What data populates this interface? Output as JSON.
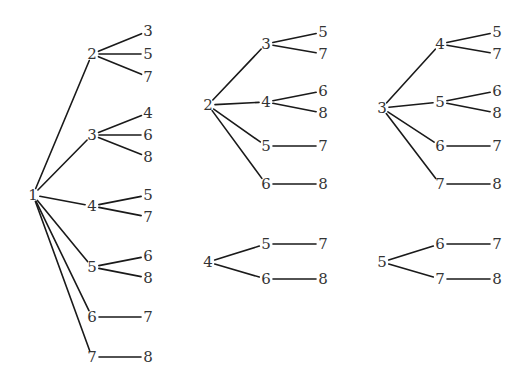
{
  "diagram": {
    "type": "tree-diagrams",
    "trees": [
      {
        "id": "tree-1",
        "root": {
          "label": "1",
          "x": 33,
          "y": 195
        },
        "children": [
          {
            "label": "2",
            "x": 92,
            "y": 54,
            "children": [
              {
                "label": "3",
                "x": 148,
                "y": 31
              },
              {
                "label": "5",
                "x": 148,
                "y": 54
              },
              {
                "label": "7",
                "x": 148,
                "y": 77
              }
            ]
          },
          {
            "label": "3",
            "x": 92,
            "y": 135,
            "children": [
              {
                "label": "4",
                "x": 148,
                "y": 113
              },
              {
                "label": "6",
                "x": 148,
                "y": 135
              },
              {
                "label": "8",
                "x": 148,
                "y": 157
              }
            ]
          },
          {
            "label": "4",
            "x": 92,
            "y": 206,
            "children": [
              {
                "label": "5",
                "x": 148,
                "y": 195
              },
              {
                "label": "7",
                "x": 148,
                "y": 217
              }
            ]
          },
          {
            "label": "5",
            "x": 92,
            "y": 267,
            "children": [
              {
                "label": "6",
                "x": 148,
                "y": 256
              },
              {
                "label": "8",
                "x": 148,
                "y": 278
              }
            ]
          },
          {
            "label": "6",
            "x": 92,
            "y": 317,
            "children": [
              {
                "label": "7",
                "x": 148,
                "y": 317
              }
            ]
          },
          {
            "label": "7",
            "x": 92,
            "y": 357,
            "children": [
              {
                "label": "8",
                "x": 148,
                "y": 357
              }
            ]
          }
        ]
      },
      {
        "id": "tree-2",
        "root": {
          "label": "2",
          "x": 208,
          "y": 105
        },
        "children": [
          {
            "label": "3",
            "x": 266,
            "y": 44,
            "children": [
              {
                "label": "5",
                "x": 323,
                "y": 32
              },
              {
                "label": "7",
                "x": 323,
                "y": 54
              }
            ]
          },
          {
            "label": "4",
            "x": 266,
            "y": 102,
            "children": [
              {
                "label": "6",
                "x": 323,
                "y": 91
              },
              {
                "label": "8",
                "x": 323,
                "y": 113
              }
            ]
          },
          {
            "label": "5",
            "x": 266,
            "y": 146,
            "children": [
              {
                "label": "7",
                "x": 323,
                "y": 146
              }
            ]
          },
          {
            "label": "6",
            "x": 266,
            "y": 184,
            "children": [
              {
                "label": "8",
                "x": 323,
                "y": 184
              }
            ]
          }
        ]
      },
      {
        "id": "tree-3",
        "root": {
          "label": "3",
          "x": 382,
          "y": 108
        },
        "children": [
          {
            "label": "4",
            "x": 440,
            "y": 44,
            "children": [
              {
                "label": "5",
                "x": 497,
                "y": 32
              },
              {
                "label": "7",
                "x": 497,
                "y": 54
              }
            ]
          },
          {
            "label": "5",
            "x": 440,
            "y": 102,
            "children": [
              {
                "label": "6",
                "x": 497,
                "y": 91
              },
              {
                "label": "8",
                "x": 497,
                "y": 113
              }
            ]
          },
          {
            "label": "6",
            "x": 440,
            "y": 146,
            "children": [
              {
                "label": "7",
                "x": 497,
                "y": 146
              }
            ]
          },
          {
            "label": "7",
            "x": 440,
            "y": 184,
            "children": [
              {
                "label": "8",
                "x": 497,
                "y": 184
              }
            ]
          }
        ]
      },
      {
        "id": "tree-4",
        "root": {
          "label": "4",
          "x": 208,
          "y": 262
        },
        "children": [
          {
            "label": "5",
            "x": 266,
            "y": 244,
            "children": [
              {
                "label": "7",
                "x": 323,
                "y": 244
              }
            ]
          },
          {
            "label": "6",
            "x": 266,
            "y": 279,
            "children": [
              {
                "label": "8",
                "x": 323,
                "y": 279
              }
            ]
          }
        ]
      },
      {
        "id": "tree-5",
        "root": {
          "label": "5",
          "x": 382,
          "y": 262
        },
        "children": [
          {
            "label": "6",
            "x": 440,
            "y": 244,
            "children": [
              {
                "label": "7",
                "x": 497,
                "y": 244
              }
            ]
          },
          {
            "label": "7",
            "x": 440,
            "y": 279,
            "children": [
              {
                "label": "8",
                "x": 497,
                "y": 279
              }
            ]
          }
        ]
      }
    ]
  }
}
